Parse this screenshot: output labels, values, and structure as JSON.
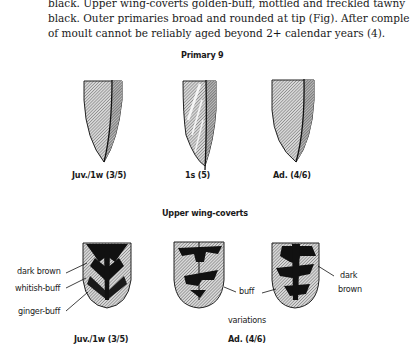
{
  "text": {
    "lines": [
      "black. Upper wing-coverts golden-buff, mottled and freckled tawny",
      "black. Outer primaries broad and rounded at tip (Fig). After comple",
      "of moult cannot be reliably aged beyond 2+ calendar years (4)."
    ]
  },
  "figure": {
    "primary_section": {
      "title": "Primary 9",
      "feathers": [
        {
          "label": "Juv./1w (3/5)"
        },
        {
          "label": "1s (5)"
        },
        {
          "label": "Ad. (4/6)"
        }
      ]
    },
    "coverts_section": {
      "title": "Upper wing-coverts",
      "left_labels": [
        "dark brown",
        "whitish-buff",
        "ginger-buff"
      ],
      "buff_label": "buff",
      "right_label_line1": "dark",
      "right_label_line2": "brown",
      "variations_label": "variations",
      "juv_label": "Juv./1w (3/5)",
      "ad_label": "Ad. (4/6)"
    }
  }
}
